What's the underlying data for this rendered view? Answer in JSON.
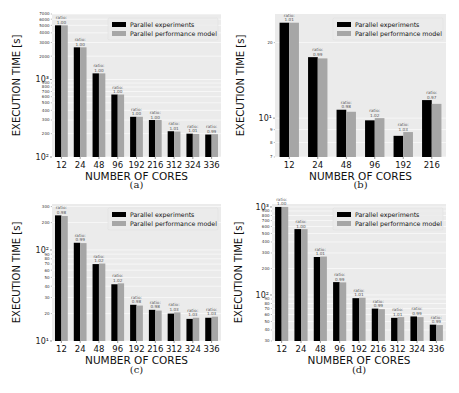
{
  "chart_data": [
    {
      "id": "a",
      "type": "bar",
      "caption": "(a)",
      "xlabel": "NUMBER OF CORES",
      "ylabel": "EXECUTION TIME [s]",
      "yscale": "log",
      "ylim": [
        100,
        7000
      ],
      "major_ticks": [
        {
          "value": 100,
          "label": "10²"
        },
        {
          "value": 1000,
          "label": "10³"
        }
      ],
      "minor_ticks": [
        200,
        300,
        400,
        500,
        600,
        700,
        800,
        900,
        2000,
        3000,
        4000,
        5000,
        6000,
        7000
      ],
      "categories": [
        "12",
        "24",
        "48",
        "96",
        "192",
        "216",
        "312",
        "324",
        "336"
      ],
      "series": [
        {
          "name": "Parallel experiments",
          "color": "#000000",
          "values": [
            5000,
            2600,
            1200,
            640,
            330,
            300,
            215,
            200,
            195
          ]
        },
        {
          "name": "Parallel performance model",
          "color": "#a6a6a6",
          "values": [
            5000,
            2600,
            1200,
            640,
            330,
            300,
            213,
            198,
            197
          ]
        }
      ],
      "ratio_prefix": "ratio:",
      "ratios": [
        "1.00",
        "1.00",
        "1.00",
        "1.00",
        "1.00",
        "1.00",
        "1.01",
        "1.01",
        "0.99"
      ],
      "legend_position": "top-right"
    },
    {
      "id": "b",
      "type": "bar",
      "caption": "(b)",
      "xlabel": "NUMBER OF CORES",
      "ylabel": "EXECUTION TIME [s]",
      "yscale": "log",
      "ylim": [
        7,
        26
      ],
      "major_ticks": [
        {
          "value": 10,
          "label": "10¹"
        }
      ],
      "minor_ticks": [
        7,
        8,
        9,
        20
      ],
      "categories": [
        "12",
        "24",
        "48",
        "96",
        "192",
        "216"
      ],
      "series": [
        {
          "name": "Parallel experiments",
          "color": "#000000",
          "values": [
            24,
            17.5,
            10.8,
            9.8,
            8.5,
            11.8
          ]
        },
        {
          "name": "Parallel performance model",
          "color": "#a6a6a6",
          "values": [
            24,
            17.3,
            10.6,
            10.0,
            8.8,
            11.4
          ]
        }
      ],
      "ratio_prefix": "ratio:",
      "ratios": [
        "1.01",
        "0.99",
        "0.98",
        "1.02",
        "1.03",
        "0.97"
      ],
      "legend_position": "top-right"
    },
    {
      "id": "c",
      "type": "bar",
      "caption": "(c)",
      "xlabel": "NUMBER OF CORES",
      "ylabel": "EXECUTION TIME [s]",
      "yscale": "log",
      "ylim": [
        10,
        320
      ],
      "major_ticks": [
        {
          "value": 10,
          "label": "10¹"
        },
        {
          "value": 100,
          "label": "10²"
        }
      ],
      "minor_ticks": [
        20,
        30,
        40,
        50,
        60,
        70,
        80,
        90,
        200,
        300
      ],
      "categories": [
        "12",
        "24",
        "48",
        "96",
        "192",
        "216",
        "312",
        "324",
        "336"
      ],
      "series": [
        {
          "name": "Parallel experiments",
          "color": "#000000",
          "values": [
            240,
            120,
            70,
            42,
            25,
            22,
            20,
            17.5,
            18
          ]
        },
        {
          "name": "Parallel performance model",
          "color": "#a6a6a6",
          "values": [
            236,
            119,
            71,
            43,
            24.5,
            21.6,
            20.6,
            18,
            18.5
          ]
        }
      ],
      "ratio_prefix": "ratio:",
      "ratios": [
        "0.98",
        "0.99",
        "1.02",
        "1.02",
        "0.98",
        "0.98",
        "1.03",
        "1.03",
        "1.03"
      ],
      "legend_position": "top-right"
    },
    {
      "id": "d",
      "type": "bar",
      "caption": "(d)",
      "xlabel": "NUMBER OF CORES",
      "ylabel": "EXECUTION TIME [s]",
      "yscale": "log",
      "ylim": [
        30,
        1080
      ],
      "major_ticks": [
        {
          "value": 100,
          "label": "10²"
        },
        {
          "value": 1000,
          "label": "10³"
        }
      ],
      "minor_ticks": [
        30,
        40,
        50,
        60,
        70,
        80,
        90,
        200,
        300,
        400,
        500,
        600,
        700,
        800,
        900
      ],
      "categories": [
        "12",
        "24",
        "48",
        "96",
        "192",
        "216",
        "312",
        "324",
        "336"
      ],
      "series": [
        {
          "name": "Parallel experiments",
          "color": "#000000",
          "values": [
            1000,
            560,
            270,
            140,
            92,
            70,
            55,
            57,
            46
          ]
        },
        {
          "name": "Parallel performance model",
          "color": "#a6a6a6",
          "values": [
            1000,
            560,
            273,
            139,
            93,
            69,
            56,
            56,
            45.5
          ]
        }
      ],
      "ratio_prefix": "ratio:",
      "ratios": [
        "1.00",
        "1.00",
        "1.01",
        "0.99",
        "1.01",
        "0.99",
        "1.01",
        "0.99",
        "0.99"
      ],
      "legend_position": "top-right"
    }
  ]
}
